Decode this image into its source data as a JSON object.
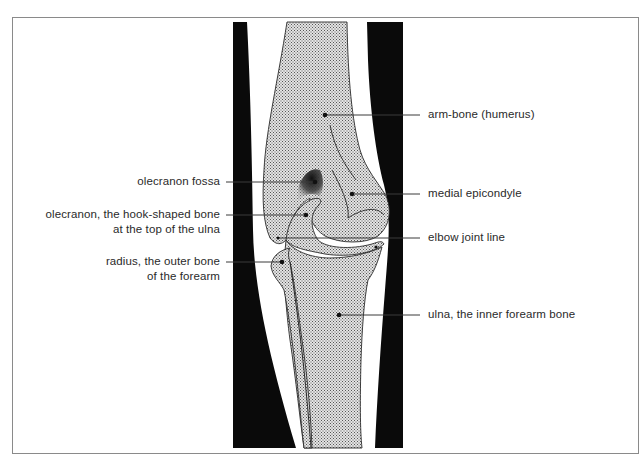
{
  "diagram": {
    "colors": {
      "soft_tissue": "#0a0a0a",
      "bone_fill": "#c9c9c9",
      "outline": "#2a2a2a",
      "leader_line": "#3a3a3a",
      "frame": "#8a8a8a",
      "text": "#2a2a2a"
    },
    "labels": {
      "left": [
        {
          "id": "olecranon-fossa",
          "line1": "olecranon fossa",
          "line2": ""
        },
        {
          "id": "olecranon",
          "line1": "olecranon, the hook-shaped bone",
          "line2": "at the top of the ulna"
        },
        {
          "id": "radius",
          "line1": "radius, the outer bone",
          "line2": "of the forearm"
        }
      ],
      "right": [
        {
          "id": "humerus",
          "line1": "arm-bone (humerus)"
        },
        {
          "id": "medial-epicondyle",
          "line1": "medial epicondyle"
        },
        {
          "id": "elbow-joint-line",
          "line1": "elbow joint line"
        },
        {
          "id": "ulna",
          "line1": "ulna, the inner forearm bone"
        }
      ]
    }
  }
}
